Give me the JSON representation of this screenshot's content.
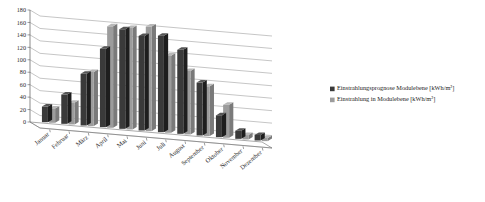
{
  "chart_data": {
    "type": "bar",
    "title": "",
    "subtitle": "",
    "xlabel": "",
    "ylabel": "",
    "ylim": [
      0,
      180
    ],
    "ytick_step": 20,
    "yticks": [
      "0",
      "20",
      "40",
      "60",
      "80",
      "100",
      "120",
      "140",
      "160",
      "180"
    ],
    "grid": true,
    "grid_axis": "y",
    "legend_position": "right",
    "style": "3d-clustered-column",
    "categories": [
      "Januar",
      "Februar",
      "März",
      "April",
      "Mai",
      "Juni",
      "Juli",
      "August",
      "September",
      "Oktober",
      "November",
      "Dezember"
    ],
    "series": [
      {
        "name": "Einstrahlungsprognose Modulebene [kWh/m²]",
        "color": "#3a3a3a",
        "values": [
          25,
          47,
          83,
          126,
          160,
          152,
          155,
          135,
          85,
          35,
          13,
          9
        ]
      },
      {
        "name": "Einstrahlung in Modulebene [kWh/m²]",
        "color": "#9c9c9c",
        "values": [
          23,
          35,
          87,
          163,
          163,
          168,
          124,
          102,
          80,
          53,
          7,
          5
        ]
      }
    ]
  },
  "legend": {
    "entries": [
      {
        "label": "Einstrahlungsprognose Modulebene [kWh/m²]",
        "swatch": "#3a3a3a"
      },
      {
        "label": "Einstrahlung in Modulebene [kWh/m²]",
        "swatch": "#9c9c9c"
      }
    ]
  },
  "axes": {
    "y_max_label": "180",
    "y_min_label": "0"
  }
}
